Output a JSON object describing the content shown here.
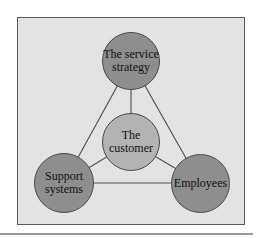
{
  "diagram": {
    "type": "triangle-hub",
    "nodes": [
      {
        "id": "top",
        "label_line1": "The service",
        "label_line2": "strategy"
      },
      {
        "id": "center",
        "label_line1": "The",
        "label_line2": "customer"
      },
      {
        "id": "left",
        "label_line1": "Support",
        "label_line2": "systems"
      },
      {
        "id": "right",
        "label_line1": "Employees",
        "label_line2": ""
      }
    ],
    "edges": [
      [
        "top",
        "left"
      ],
      [
        "top",
        "right"
      ],
      [
        "left",
        "right"
      ],
      [
        "center",
        "top"
      ],
      [
        "center",
        "left"
      ],
      [
        "center",
        "right"
      ]
    ],
    "colors": {
      "frame_bg": "#e3e3e3",
      "outer_node": "#8e8e8e",
      "center_node": "#b3b3b3",
      "edge": "#555555"
    }
  }
}
